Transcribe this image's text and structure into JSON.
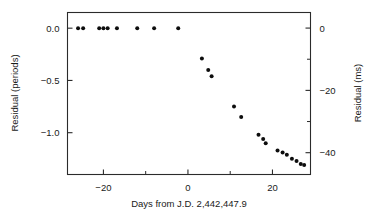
{
  "figure": {
    "background_color": "#ffffff",
    "foreground_color": "#1a1a1a",
    "marker_color": "#0d0d0d"
  },
  "chart_data": {
    "type": "scatter",
    "title": "",
    "xlabel": "Days from J.D. 2,442,447.9",
    "ylabel": "Residual (periods)",
    "y2label": "Residual (ms)",
    "xlim": [
      -28.5,
      29.0
    ],
    "ylim": [
      -1.4,
      0.15
    ],
    "y2lim": [
      -47.0,
      5.0
    ],
    "grid": false,
    "legend": null,
    "xticks": [
      -20,
      0,
      20
    ],
    "xticklabels": [
      "−20",
      "0",
      "20"
    ],
    "xticks_minor": [
      -10,
      10
    ],
    "yticks": [
      0.0,
      -0.5,
      -1.0
    ],
    "yticklabels": [
      "0.0",
      "−0.5",
      "−1.0"
    ],
    "y2ticks": [
      0,
      -20,
      -40
    ],
    "y2ticklabels": [
      "0",
      "−20",
      "−40"
    ],
    "y2ticks_minor": [
      -10,
      -30
    ],
    "points": [
      {
        "x": -26.0,
        "y": 0.0
      },
      {
        "x": -24.8,
        "y": 0.0
      },
      {
        "x": -21.0,
        "y": 0.0
      },
      {
        "x": -20.0,
        "y": 0.0
      },
      {
        "x": -19.0,
        "y": 0.0
      },
      {
        "x": -16.8,
        "y": 0.0
      },
      {
        "x": -12.0,
        "y": 0.0
      },
      {
        "x": -8.0,
        "y": 0.0
      },
      {
        "x": -2.3,
        "y": 0.0
      },
      {
        "x": 3.3,
        "y": -0.29
      },
      {
        "x": 4.8,
        "y": -0.4
      },
      {
        "x": 5.6,
        "y": -0.46
      },
      {
        "x": 10.9,
        "y": -0.75
      },
      {
        "x": 12.6,
        "y": -0.85
      },
      {
        "x": 16.7,
        "y": -1.02
      },
      {
        "x": 17.8,
        "y": -1.06
      },
      {
        "x": 18.4,
        "y": -1.1
      },
      {
        "x": 21.2,
        "y": -1.17
      },
      {
        "x": 22.4,
        "y": -1.19
      },
      {
        "x": 23.4,
        "y": -1.21
      },
      {
        "x": 24.6,
        "y": -1.25
      },
      {
        "x": 25.7,
        "y": -1.27
      },
      {
        "x": 26.7,
        "y": -1.3
      },
      {
        "x": 27.5,
        "y": -1.31
      }
    ]
  }
}
